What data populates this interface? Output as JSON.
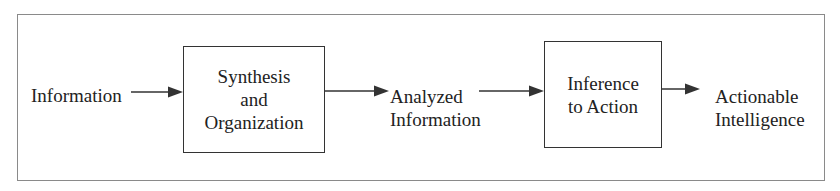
{
  "diagram": {
    "type": "flowchart",
    "direction": "left-to-right",
    "nodes": [
      {
        "id": "input",
        "kind": "label",
        "lines": [
          "Information"
        ]
      },
      {
        "id": "synthesis",
        "kind": "box",
        "lines": [
          "Synthesis",
          "and",
          "Organization"
        ]
      },
      {
        "id": "analyzed",
        "kind": "label",
        "lines": [
          "Analyzed",
          "Information"
        ]
      },
      {
        "id": "inference",
        "kind": "box",
        "lines": [
          "Inference",
          "to Action"
        ]
      },
      {
        "id": "output",
        "kind": "label",
        "lines": [
          "Actionable",
          "Intelligence"
        ]
      }
    ],
    "edges": [
      {
        "from": "input",
        "to": "synthesis"
      },
      {
        "from": "synthesis",
        "to": "analyzed"
      },
      {
        "from": "analyzed",
        "to": "inference"
      },
      {
        "from": "inference",
        "to": "output"
      }
    ],
    "colors": {
      "line": "#333333",
      "frame": "#8a8a8a",
      "text": "#222222",
      "background": "#ffffff"
    }
  }
}
